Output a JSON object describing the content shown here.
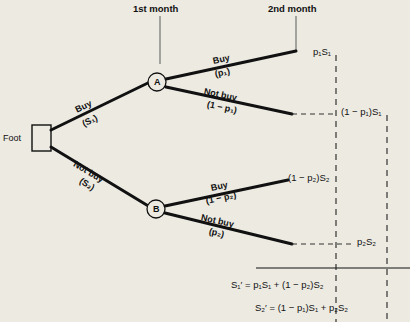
{
  "figure": {
    "title_top_left": "1st month",
    "title_top_right": "2nd month",
    "root": {
      "label": "Foot",
      "shape": "rectangle"
    },
    "nodes": [
      {
        "id": "A",
        "label": "A",
        "shape": "circle"
      },
      {
        "id": "B",
        "label": "B",
        "shape": "circle"
      }
    ],
    "branches": [
      {
        "id": "root-up",
        "action": "Buy",
        "value": "(S₁)",
        "from": "Foot",
        "to": "A"
      },
      {
        "id": "root-down",
        "action": "Not buy",
        "value": "(S₂)",
        "from": "Foot",
        "to": "B"
      },
      {
        "id": "a-up",
        "action": "Buy",
        "value": "(p₁)",
        "from": "A",
        "to": "p1S1"
      },
      {
        "id": "a-down",
        "action": "Not buy",
        "value": "(1 − p₁)",
        "from": "A",
        "to": "1-p1S1"
      },
      {
        "id": "b-up",
        "action": "Buy",
        "value": "(1 − p₂)",
        "from": "B",
        "to": "1-p2S2"
      },
      {
        "id": "b-down",
        "action": "Not buy",
        "value": "(p₂)",
        "from": "B",
        "to": "p2S2"
      }
    ],
    "outcomes": [
      {
        "id": "p1S1",
        "label": "p₁S₁"
      },
      {
        "id": "1-p1S1",
        "label": "(1 − p₁)S₁"
      },
      {
        "id": "1-p2S2",
        "label": "(1 − p₂)S₂"
      },
      {
        "id": "p2S2",
        "label": "p₂S₂"
      }
    ],
    "formulas": [
      {
        "id": "s1-prime",
        "text": "S₁′ = p₁S₁ + (1 − p₂)S₂"
      },
      {
        "id": "s2-prime",
        "text": "S₂′ = (1 − p₁)S₁ + p₂S₂"
      }
    ],
    "colors": {
      "background": "#eceae1",
      "ink": "#111111",
      "rule": "#5a5a5a"
    }
  }
}
